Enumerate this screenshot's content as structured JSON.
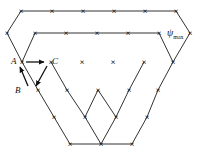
{
  "figure": {
    "background_color": "#ffffff",
    "marker_glyph": "×",
    "marker_color": "#111111",
    "line_color": "#222222",
    "width": 198,
    "height": 164
  },
  "labels": {
    "a": "A",
    "b": "B",
    "c": "C",
    "psi_symbol": "ψ",
    "psi_subscript": "max",
    "psi_full": "ψmax"
  },
  "arrows": {
    "a_to_c": "A→C",
    "c_to_b": "C→B",
    "b_to_a": "B→A"
  },
  "chart_data": {
    "type": "scatter",
    "title": "",
    "xlabel": "",
    "ylabel": "",
    "xlim": [
      0,
      198
    ],
    "ylim": [
      0,
      164
    ],
    "grid": false,
    "legend": "none",
    "marker": "x",
    "annotations": [
      "A",
      "B",
      "C",
      "ψmax"
    ],
    "nodes": [
      [
        21,
        11
      ],
      [
        52,
        11
      ],
      [
        83,
        11
      ],
      [
        114,
        11
      ],
      [
        145,
        11
      ],
      [
        176,
        11
      ],
      [
        7,
        33
      ],
      [
        35,
        33
      ],
      [
        66,
        33
      ],
      [
        97,
        33
      ],
      [
        128,
        33
      ],
      [
        159,
        33
      ],
      [
        190,
        33
      ],
      [
        22,
        62
      ],
      [
        51,
        62
      ],
      [
        82,
        62
      ],
      [
        113,
        62
      ],
      [
        144,
        62
      ],
      [
        173,
        62
      ],
      [
        38,
        90
      ],
      [
        67,
        90
      ],
      [
        98,
        90
      ],
      [
        129,
        90
      ],
      [
        158,
        90
      ],
      [
        54,
        117
      ],
      [
        85,
        117
      ],
      [
        116,
        117
      ],
      [
        147,
        117
      ],
      [
        70,
        144
      ],
      [
        101,
        144
      ],
      [
        132,
        144
      ]
    ],
    "edges": [
      [
        [
          21,
          11
        ],
        [
          176,
          11
        ]
      ],
      [
        [
          35,
          33
        ],
        [
          159,
          33
        ]
      ],
      [
        [
          21,
          11
        ],
        [
          7,
          33
        ]
      ],
      [
        [
          7,
          33
        ],
        [
          22,
          62
        ]
      ],
      [
        [
          176,
          11
        ],
        [
          190,
          33
        ]
      ],
      [
        [
          190,
          33
        ],
        [
          173,
          62
        ]
      ],
      [
        [
          173,
          62
        ],
        [
          158,
          90
        ]
      ],
      [
        [
          158,
          90
        ],
        [
          147,
          117
        ]
      ],
      [
        [
          147,
          117
        ],
        [
          132,
          144
        ]
      ],
      [
        [
          70,
          144
        ],
        [
          132,
          144
        ]
      ],
      [
        [
          22,
          62
        ],
        [
          38,
          90
        ]
      ],
      [
        [
          38,
          90
        ],
        [
          54,
          117
        ]
      ],
      [
        [
          54,
          117
        ],
        [
          70,
          144
        ]
      ],
      [
        [
          35,
          33
        ],
        [
          22,
          62
        ]
      ],
      [
        [
          159,
          33
        ],
        [
          173,
          62
        ]
      ],
      [
        [
          51,
          62
        ],
        [
          67,
          90
        ]
      ],
      [
        [
          67,
          90
        ],
        [
          85,
          117
        ]
      ],
      [
        [
          144,
          62
        ],
        [
          129,
          90
        ]
      ],
      [
        [
          129,
          90
        ],
        [
          116,
          117
        ]
      ],
      [
        [
          85,
          117
        ],
        [
          101,
          144
        ]
      ],
      [
        [
          116,
          117
        ],
        [
          101,
          144
        ]
      ],
      [
        [
          98,
          90
        ],
        [
          85,
          117
        ]
      ],
      [
        [
          98,
          90
        ],
        [
          116,
          117
        ]
      ]
    ]
  }
}
